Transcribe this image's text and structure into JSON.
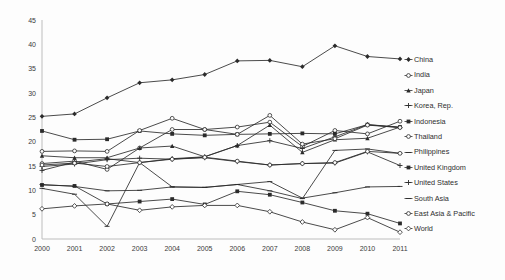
{
  "chart_data": {
    "type": "line",
    "title": "",
    "xlabel": "",
    "ylabel": "",
    "x": [
      2000,
      2001,
      2002,
      2003,
      2004,
      2005,
      2006,
      2007,
      2008,
      2009,
      2010,
      2011
    ],
    "xtick_labels": [
      "2000",
      "2001",
      "2002",
      "2003",
      "2004",
      "2005",
      "2006",
      "2007",
      "2008",
      "2009",
      "2010",
      "2011"
    ],
    "ytick_labels": [
      "0",
      "5",
      "10",
      "15",
      "20",
      "25",
      "30",
      "35",
      "40",
      "45"
    ],
    "yticks": [
      0,
      5,
      10,
      15,
      20,
      25,
      30,
      35,
      40,
      45
    ],
    "ylim": [
      0,
      45
    ],
    "grid": false,
    "legend_position": "right",
    "series": [
      {
        "name": "China",
        "marker": "diamond",
        "values": [
          25.2,
          25.7,
          29.0,
          32.1,
          32.7,
          33.8,
          36.6,
          36.7,
          35.4,
          39.7,
          37.5,
          37.0
        ]
      },
      {
        "name": "India",
        "marker": "circle-open",
        "values": [
          15.5,
          16.0,
          14.3,
          18.7,
          22.5,
          22.5,
          23.0,
          24.0,
          19.0,
          22.3,
          21.6,
          24.2
        ]
      },
      {
        "name": "Japan",
        "marker": "triangle",
        "values": [
          17.1,
          16.7,
          16.7,
          18.7,
          19.1,
          16.9,
          19.2,
          23.4,
          17.8,
          20.4,
          20.7,
          23.0
        ]
      },
      {
        "name": "Korea, Rep.",
        "marker": "cross",
        "values": [
          14.1,
          15.8,
          16.5,
          15.7,
          16.5,
          16.9,
          19.2,
          20.2,
          18.6,
          21.0,
          23.5,
          22.9
        ]
      },
      {
        "name": "Indonesia",
        "marker": "square",
        "values": [
          22.2,
          20.4,
          20.5,
          22.2,
          21.6,
          21.3,
          21.5,
          21.6,
          21.7,
          21.6,
          23.5,
          23.0
        ]
      },
      {
        "name": "Thailand",
        "marker": "circle-open",
        "values": [
          18.0,
          18.1,
          18.0,
          22.3,
          24.8,
          22.5,
          21.5,
          25.4,
          19.5,
          20.6,
          23.4,
          22.9
        ]
      },
      {
        "name": "Philippines",
        "marker": "dash",
        "values": [
          10.4,
          9.2,
          2.6,
          15.7,
          10.7,
          10.6,
          11.2,
          11.8,
          8.4,
          9.5,
          10.7,
          10.8
        ]
      },
      {
        "name": "United Kingdom",
        "marker": "square",
        "values": [
          11.1,
          10.9,
          7.2,
          7.7,
          8.2,
          7.1,
          9.8,
          9.1,
          7.5,
          5.8,
          5.2,
          3.2
        ]
      },
      {
        "name": "United States",
        "marker": "plus",
        "values": [
          14.9,
          15.4,
          16.3,
          16.6,
          16.4,
          16.7,
          15.9,
          15.2,
          15.5,
          15.6,
          17.9,
          15.1
        ]
      },
      {
        "name": "South Asia",
        "marker": "dash",
        "values": [
          11.2,
          10.8,
          9.9,
          10.0,
          10.7,
          10.6,
          11.2,
          9.9,
          8.3,
          18.2,
          18.5,
          17.6
        ]
      },
      {
        "name": "East Asia & Pacific",
        "marker": "circle-open",
        "values": [
          15.2,
          15.6,
          14.9,
          15.7,
          16.4,
          16.8,
          16.0,
          15.2,
          15.5,
          15.7,
          18.0,
          17.6
        ]
      },
      {
        "name": "World",
        "marker": "diamond-open",
        "values": [
          6.2,
          6.8,
          7.2,
          5.9,
          6.6,
          6.9,
          6.9,
          5.6,
          3.5,
          1.9,
          4.4,
          1.4
        ]
      }
    ]
  },
  "axis": {
    "y_max_label": "45",
    "y_min_label": "0"
  }
}
